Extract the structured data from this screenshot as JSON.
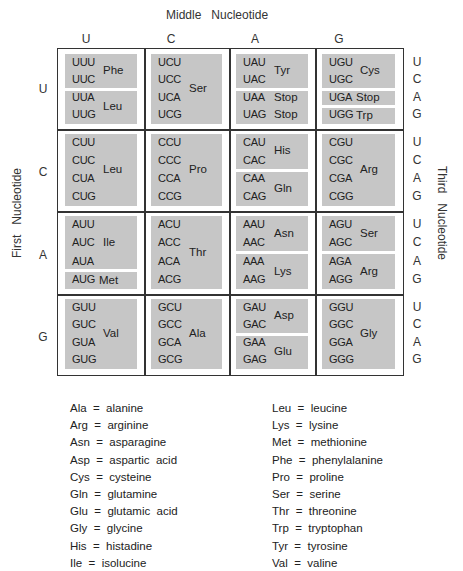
{
  "titles": {
    "middle": "Middle   Nucleotide",
    "first": "First   Nucleotide",
    "third": "Third   Nucleotide"
  },
  "middle_bases": [
    "U",
    "C",
    "A",
    "G"
  ],
  "first_bases": [
    "U",
    "C",
    "A",
    "G"
  ],
  "third_bases": [
    "U",
    "C",
    "A",
    "G"
  ],
  "cells": {
    "UU": {
      "codons": [
        "UUU",
        "UUC",
        "UUA",
        "UUG"
      ],
      "groups": [
        {
          "rows": [
            0,
            1
          ],
          "aa": "Phe"
        },
        {
          "rows": [
            2,
            3
          ],
          "aa": "Leu"
        }
      ]
    },
    "UC": {
      "codons": [
        "UCU",
        "UCC",
        "UCA",
        "UCG"
      ],
      "groups": [
        {
          "rows": [
            0,
            3
          ],
          "aa": "Ser"
        }
      ]
    },
    "UA": {
      "codons": [
        "UAU",
        "UAC",
        "UAA",
        "UAG"
      ],
      "groups": [
        {
          "rows": [
            0,
            1
          ],
          "aa": "Tyr"
        },
        {
          "rows": [
            2,
            3
          ],
          "aa": "Stop"
        }
      ],
      "row_labels": {
        "2": "Stop",
        "3": "Stop"
      }
    },
    "UG": {
      "codons": [
        "UGU",
        "UGC",
        "UGA",
        "UGG"
      ],
      "groups": [
        {
          "rows": [
            0,
            1
          ],
          "aa": "Cys"
        },
        {
          "rows": [
            2,
            2
          ],
          "aa": "Stop"
        },
        {
          "rows": [
            3,
            3
          ],
          "aa": "Trp"
        }
      ]
    },
    "CU": {
      "codons": [
        "CUU",
        "CUC",
        "CUA",
        "CUG"
      ],
      "groups": [
        {
          "rows": [
            0,
            3
          ],
          "aa": "Leu"
        }
      ]
    },
    "CC": {
      "codons": [
        "CCU",
        "CCC",
        "CCA",
        "CCG"
      ],
      "groups": [
        {
          "rows": [
            0,
            3
          ],
          "aa": "Pro"
        }
      ]
    },
    "CA": {
      "codons": [
        "CAU",
        "CAC",
        "CAA",
        "CAG"
      ],
      "groups": [
        {
          "rows": [
            0,
            1
          ],
          "aa": "His"
        },
        {
          "rows": [
            2,
            3
          ],
          "aa": "Gln"
        }
      ]
    },
    "CG": {
      "codons": [
        "CGU",
        "CGC",
        "CGA",
        "CGG"
      ],
      "groups": [
        {
          "rows": [
            0,
            3
          ],
          "aa": "Arg"
        }
      ]
    },
    "AU": {
      "codons": [
        "AUU",
        "AUC",
        "AUA",
        "AUG"
      ],
      "groups": [
        {
          "rows": [
            0,
            2
          ],
          "aa": "Ile"
        },
        {
          "rows": [
            3,
            3
          ],
          "aa": "Met"
        }
      ]
    },
    "AC": {
      "codons": [
        "ACU",
        "ACC",
        "ACA",
        "ACG"
      ],
      "groups": [
        {
          "rows": [
            0,
            3
          ],
          "aa": "Thr"
        }
      ]
    },
    "AA": {
      "codons": [
        "AAU",
        "AAC",
        "AAA",
        "AAG"
      ],
      "groups": [
        {
          "rows": [
            0,
            1
          ],
          "aa": "Asn"
        },
        {
          "rows": [
            2,
            3
          ],
          "aa": "Lys"
        }
      ]
    },
    "AG": {
      "codons": [
        "AGU",
        "AGC",
        "AGA",
        "AGG"
      ],
      "groups": [
        {
          "rows": [
            0,
            1
          ],
          "aa": "Ser"
        },
        {
          "rows": [
            2,
            3
          ],
          "aa": "Arg"
        }
      ]
    },
    "GU": {
      "codons": [
        "GUU",
        "GUC",
        "GUA",
        "GUG"
      ],
      "groups": [
        {
          "rows": [
            0,
            3
          ],
          "aa": "Val"
        }
      ]
    },
    "GC": {
      "codons": [
        "GCU",
        "GCC",
        "GCA",
        "GCG"
      ],
      "groups": [
        {
          "rows": [
            0,
            3
          ],
          "aa": "Ala"
        }
      ]
    },
    "GA": {
      "codons": [
        "GAU",
        "GAC",
        "GAA",
        "GAG"
      ],
      "groups": [
        {
          "rows": [
            0,
            1
          ],
          "aa": "Asp"
        },
        {
          "rows": [
            2,
            3
          ],
          "aa": "Glu"
        }
      ]
    },
    "GG": {
      "codons": [
        "GGU",
        "GGC",
        "GGA",
        "GGG"
      ],
      "groups": [
        {
          "rows": [
            0,
            3
          ],
          "aa": "Gly"
        }
      ]
    }
  },
  "legend": {
    "left": [
      "Ala  =  alanine",
      "Arg  =  arginine",
      "Asn  =  asparagine",
      "Asp  =  aspartic  acid",
      "Cys  =  cysteine",
      "Gln  =  glutamine",
      "Glu  =  glutamic  acid",
      "Gly  =  glycine",
      "His  =  histadine",
      "Ile  =  isolucine"
    ],
    "right": [
      "Leu  =  leucine",
      "Lys  =  lysine",
      "Met  =  methionine",
      "Phe  =  phenylalanine",
      "Pro  =  proline",
      "Ser  =  serine",
      "Thr  =  threonine",
      "Trp  =  tryptophan",
      "Tyr  =  tyrosine",
      "Val  =  valine"
    ]
  },
  "colors": {
    "block_fill": "#c6c6c6",
    "grid_line": "#333333",
    "text": "#222222"
  }
}
